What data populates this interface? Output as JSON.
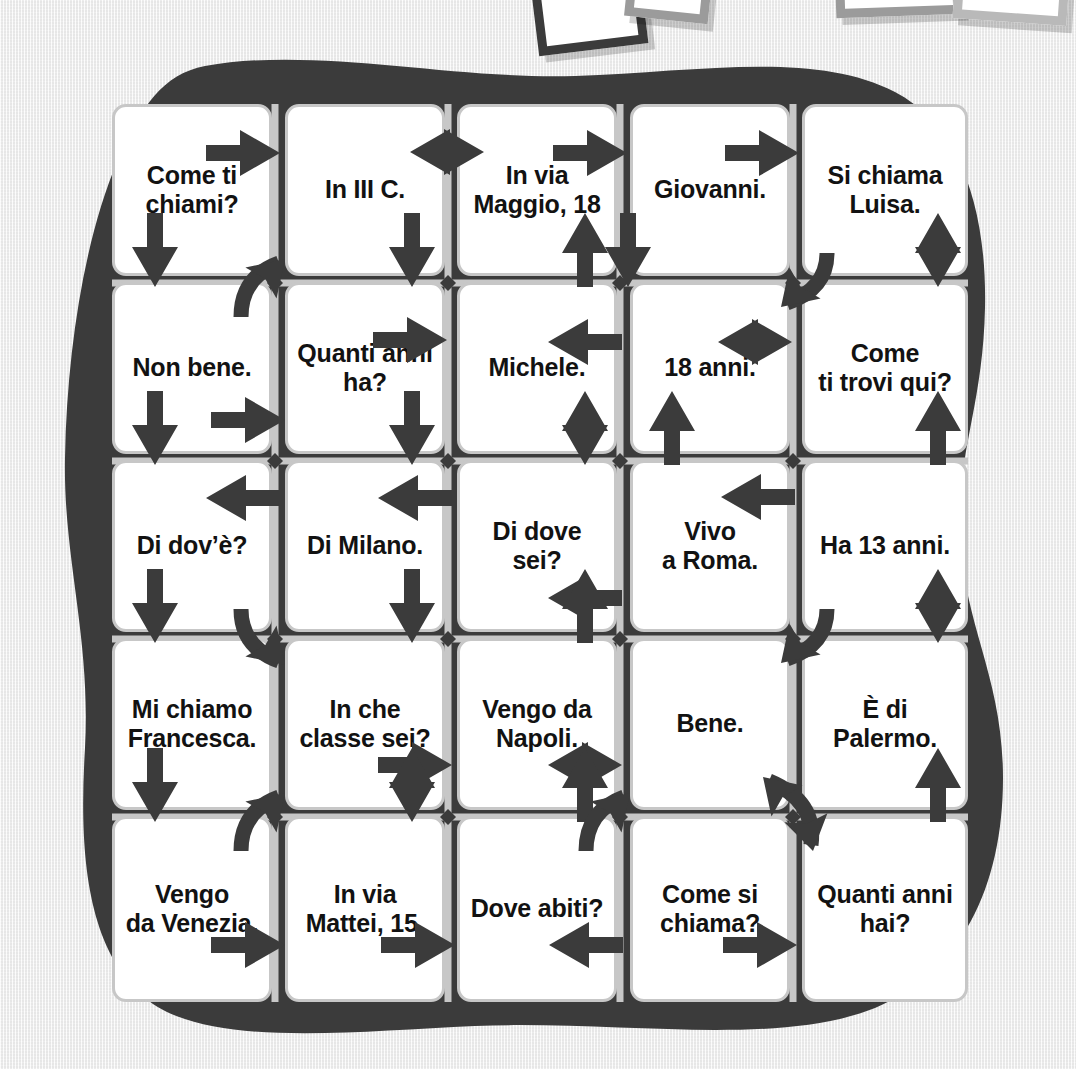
{
  "page": {
    "background_color": "#f2f2f2",
    "blob_color": "#3b3b3b",
    "cell_border_color": "#c7c7c7",
    "gridline_color": "#c7c7c7",
    "arrow_color": "#3b3b3b",
    "text_color": "#121212"
  },
  "grid": {
    "rows": 5,
    "cols": 5,
    "cells": [
      {
        "id": "r1c1",
        "row": 1,
        "col": 1,
        "lines": [
          "Come ti",
          "chiami?"
        ]
      },
      {
        "id": "r1c2",
        "row": 1,
        "col": 2,
        "lines": [
          "In III C."
        ]
      },
      {
        "id": "r1c3",
        "row": 1,
        "col": 3,
        "lines": [
          "In via",
          "Maggio, 18"
        ]
      },
      {
        "id": "r1c4",
        "row": 1,
        "col": 4,
        "lines": [
          "Giovanni."
        ]
      },
      {
        "id": "r1c5",
        "row": 1,
        "col": 5,
        "lines": [
          "Si chiama",
          "Luisa."
        ]
      },
      {
        "id": "r2c1",
        "row": 2,
        "col": 1,
        "lines": [
          "Non bene."
        ]
      },
      {
        "id": "r2c2",
        "row": 2,
        "col": 2,
        "lines": [
          "Quanti anni",
          "ha?"
        ]
      },
      {
        "id": "r2c3",
        "row": 2,
        "col": 3,
        "lines": [
          "Michele."
        ]
      },
      {
        "id": "r2c4",
        "row": 2,
        "col": 4,
        "lines": [
          "18 anni."
        ]
      },
      {
        "id": "r2c5",
        "row": 2,
        "col": 5,
        "lines": [
          "Come",
          "ti trovi qui?"
        ]
      },
      {
        "id": "r3c1",
        "row": 3,
        "col": 1,
        "lines": [
          "Di dov’è?"
        ]
      },
      {
        "id": "r3c2",
        "row": 3,
        "col": 2,
        "lines": [
          "Di Milano."
        ]
      },
      {
        "id": "r3c3",
        "row": 3,
        "col": 3,
        "lines": [
          "Di dove sei?"
        ]
      },
      {
        "id": "r3c4",
        "row": 3,
        "col": 4,
        "lines": [
          "Vivo",
          "a Roma."
        ]
      },
      {
        "id": "r3c5",
        "row": 3,
        "col": 5,
        "lines": [
          "Ha 13 anni."
        ]
      },
      {
        "id": "r4c1",
        "row": 4,
        "col": 1,
        "lines": [
          "Mi chiamo",
          "Francesca."
        ]
      },
      {
        "id": "r4c2",
        "row": 4,
        "col": 2,
        "lines": [
          "In che",
          "classe sei?"
        ]
      },
      {
        "id": "r4c3",
        "row": 4,
        "col": 3,
        "lines": [
          "Vengo da",
          "Napoli."
        ]
      },
      {
        "id": "r4c4",
        "row": 4,
        "col": 4,
        "lines": [
          "Bene."
        ]
      },
      {
        "id": "r4c5",
        "row": 4,
        "col": 5,
        "lines": [
          "È di",
          "Palermo."
        ]
      },
      {
        "id": "r5c1",
        "row": 5,
        "col": 1,
        "lines": [
          "Vengo",
          "da Venezia."
        ]
      },
      {
        "id": "r5c2",
        "row": 5,
        "col": 2,
        "lines": [
          "In via",
          "Mattei, 15."
        ]
      },
      {
        "id": "r5c3",
        "row": 5,
        "col": 3,
        "lines": [
          "Dove abiti?"
        ]
      },
      {
        "id": "r5c4",
        "row": 5,
        "col": 4,
        "lines": [
          "Come si",
          "chiama?"
        ]
      },
      {
        "id": "r5c5",
        "row": 5,
        "col": 5,
        "lines": [
          "Quanti anni",
          "hai?"
        ]
      }
    ]
  },
  "arrows": [
    {
      "name": "arrow-right-r1c1-r1c2",
      "icon": "arrow-right-icon",
      "x": 243,
      "y": 153,
      "rot": 0,
      "len": 74,
      "style": "single"
    },
    {
      "name": "arrow-double-h-r1c2-r1c3",
      "icon": "arrow-double-horiz-icon",
      "x": 447,
      "y": 152,
      "rot": 0,
      "len": 74,
      "style": "double"
    },
    {
      "name": "arrow-right-r1c3-r1c4",
      "icon": "arrow-right-icon",
      "x": 590,
      "y": 153,
      "rot": 0,
      "len": 74,
      "style": "single"
    },
    {
      "name": "arrow-right-r1c4-r1c5",
      "icon": "arrow-right-icon",
      "x": 762,
      "y": 153,
      "rot": 0,
      "len": 74,
      "style": "single"
    },
    {
      "name": "arrow-down-r1c1-r2c1",
      "icon": "arrow-down-icon",
      "x": 155,
      "y": 250,
      "rot": 90,
      "len": 74,
      "style": "single"
    },
    {
      "name": "arrow-curve-up-right-r2c1",
      "icon": "arrow-curve-icon",
      "x": 275,
      "y": 283,
      "rot": 0,
      "len": 74,
      "style": "curve-ne"
    },
    {
      "name": "arrow-down-r1c2-r2c2",
      "icon": "arrow-down-icon",
      "x": 412,
      "y": 250,
      "rot": 90,
      "len": 74,
      "style": "single"
    },
    {
      "name": "arrow-up-r2c3-r1c3",
      "icon": "arrow-up-icon",
      "x": 585,
      "y": 250,
      "rot": -90,
      "len": 74,
      "style": "single"
    },
    {
      "name": "arrow-down-r1c4-r2c4",
      "icon": "arrow-down-icon",
      "x": 628,
      "y": 250,
      "rot": 90,
      "len": 74,
      "style": "single"
    },
    {
      "name": "arrow-curve-left-r1c5",
      "icon": "arrow-curve-icon",
      "x": 793,
      "y": 283,
      "rot": 0,
      "len": 74,
      "style": "curve-sw"
    },
    {
      "name": "arrow-double-v-r1c5-r2c5",
      "icon": "arrow-double-vert-icon",
      "x": 938,
      "y": 250,
      "rot": 90,
      "len": 74,
      "style": "double"
    },
    {
      "name": "arrow-right-r2c2-r2c3",
      "icon": "arrow-right-icon",
      "x": 410,
      "y": 340,
      "rot": 0,
      "len": 74,
      "style": "single"
    },
    {
      "name": "arrow-left-r2c4-r2c3",
      "icon": "arrow-left-icon",
      "x": 585,
      "y": 342,
      "rot": 180,
      "len": 74,
      "style": "single"
    },
    {
      "name": "arrow-double-h-r2c4-r2c5",
      "icon": "arrow-double-horiz-icon",
      "x": 755,
      "y": 342,
      "rot": 0,
      "len": 74,
      "style": "double"
    },
    {
      "name": "arrow-right-r2c1-r2c2",
      "icon": "arrow-right-icon",
      "x": 248,
      "y": 420,
      "rot": 0,
      "len": 74,
      "style": "single"
    },
    {
      "name": "arrow-down-r2c2-r3c2",
      "icon": "arrow-down-icon",
      "x": 412,
      "y": 428,
      "rot": 90,
      "len": 74,
      "style": "single"
    },
    {
      "name": "arrow-double-v-r2c3-r3c3",
      "icon": "arrow-double-vert-icon",
      "x": 585,
      "y": 428,
      "rot": 90,
      "len": 74,
      "style": "double"
    },
    {
      "name": "arrow-up-r3c4-r2c4",
      "icon": "arrow-up-icon",
      "x": 672,
      "y": 428,
      "rot": -90,
      "len": 74,
      "style": "single"
    },
    {
      "name": "arrow-up-r3c5-r2c5",
      "icon": "arrow-up-icon",
      "x": 938,
      "y": 428,
      "rot": -90,
      "len": 74,
      "style": "single"
    },
    {
      "name": "arrow-down-r2c1-r3c1",
      "icon": "arrow-down-icon",
      "x": 155,
      "y": 428,
      "rot": 90,
      "len": 74,
      "style": "single"
    },
    {
      "name": "arrow-left-r3c2-r3c1",
      "icon": "arrow-left-icon",
      "x": 243,
      "y": 498,
      "rot": 180,
      "len": 74,
      "style": "single"
    },
    {
      "name": "arrow-left-r3c3-r3c2",
      "icon": "arrow-left-icon",
      "x": 415,
      "y": 498,
      "rot": 180,
      "len": 74,
      "style": "single"
    },
    {
      "name": "arrow-left-r3c5-r3c4",
      "icon": "arrow-left-icon",
      "x": 758,
      "y": 497,
      "rot": 180,
      "len": 74,
      "style": "single"
    },
    {
      "name": "arrow-left-r3c4-r3c3",
      "icon": "arrow-left-icon",
      "x": 585,
      "y": 598,
      "rot": 180,
      "len": 74,
      "style": "single"
    },
    {
      "name": "arrow-down-r3c1-r4c1",
      "icon": "arrow-down-icon",
      "x": 155,
      "y": 606,
      "rot": 90,
      "len": 74,
      "style": "single"
    },
    {
      "name": "arrow-curve-down-right-r4c2",
      "icon": "arrow-curve-icon",
      "x": 275,
      "y": 639,
      "rot": 0,
      "len": 74,
      "style": "curve-se"
    },
    {
      "name": "arrow-down-r3c2-r4c2",
      "icon": "arrow-down-icon",
      "x": 412,
      "y": 606,
      "rot": 90,
      "len": 74,
      "style": "single"
    },
    {
      "name": "arrow-up-r4c3-r3c3",
      "icon": "arrow-up-icon",
      "x": 585,
      "y": 606,
      "rot": -90,
      "len": 74,
      "style": "single"
    },
    {
      "name": "arrow-curve-left-r4c4",
      "icon": "arrow-curve-icon",
      "x": 793,
      "y": 639,
      "rot": 0,
      "len": 74,
      "style": "curve-sw"
    },
    {
      "name": "arrow-double-v-r3c5-r4c5",
      "icon": "arrow-double-vert-icon",
      "x": 938,
      "y": 606,
      "rot": 90,
      "len": 74,
      "style": "double"
    },
    {
      "name": "arrow-right-r4c2-r4c3",
      "icon": "arrow-right-icon",
      "x": 415,
      "y": 765,
      "rot": 0,
      "len": 74,
      "style": "single"
    },
    {
      "name": "arrow-double-h-r4c3-r4c4",
      "icon": "arrow-double-horiz-icon",
      "x": 585,
      "y": 765,
      "rot": 0,
      "len": 74,
      "style": "double"
    },
    {
      "name": "arrow-curve-double-r4c5",
      "icon": "arrow-curve-double-icon",
      "x": 793,
      "y": 817,
      "rot": 0,
      "len": 74,
      "style": "curve-double-sw"
    },
    {
      "name": "arrow-down-r4c1-r5c1",
      "icon": "arrow-down-icon",
      "x": 155,
      "y": 785,
      "rot": 90,
      "len": 74,
      "style": "single"
    },
    {
      "name": "arrow-curve-up-right-r5c2",
      "icon": "arrow-curve-icon",
      "x": 275,
      "y": 817,
      "rot": 0,
      "len": 74,
      "style": "curve-ne"
    },
    {
      "name": "arrow-double-v-r4c2-r5c2",
      "icon": "arrow-double-vert-icon",
      "x": 412,
      "y": 785,
      "rot": 90,
      "len": 74,
      "style": "double"
    },
    {
      "name": "arrow-up-r5c3-r4c3",
      "icon": "arrow-up-icon",
      "x": 585,
      "y": 785,
      "rot": -90,
      "len": 74,
      "style": "single"
    },
    {
      "name": "arrow-curve-up-right-r5c4",
      "icon": "arrow-curve-icon",
      "x": 620,
      "y": 817,
      "rot": 0,
      "len": 74,
      "style": "curve-ne"
    },
    {
      "name": "arrow-up-r5c5-r4c5",
      "icon": "arrow-up-icon",
      "x": 938,
      "y": 785,
      "rot": -90,
      "len": 74,
      "style": "single"
    },
    {
      "name": "arrow-right-r5c1-r5c2",
      "icon": "arrow-right-icon",
      "x": 248,
      "y": 945,
      "rot": 0,
      "len": 74,
      "style": "single"
    },
    {
      "name": "arrow-right-r5c2-r5c3",
      "icon": "arrow-right-icon",
      "x": 418,
      "y": 945,
      "rot": 0,
      "len": 74,
      "style": "single"
    },
    {
      "name": "arrow-left-r5c4-r5c3",
      "icon": "arrow-left-icon",
      "x": 586,
      "y": 945,
      "rot": 180,
      "len": 74,
      "style": "single"
    },
    {
      "name": "arrow-right-r5c4-r5c5",
      "icon": "arrow-right-icon",
      "x": 760,
      "y": 945,
      "rot": 0,
      "len": 74,
      "style": "single"
    }
  ],
  "photos": [
    {
      "name": "photo-frame-1",
      "frame": "dark"
    },
    {
      "name": "photo-frame-2",
      "frame": "grey"
    },
    {
      "name": "photo-frame-3",
      "frame": "grey"
    },
    {
      "name": "photo-frame-4",
      "frame": "mid"
    }
  ]
}
